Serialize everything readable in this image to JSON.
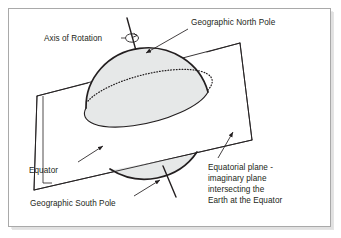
{
  "figure": {
    "type": "diagram",
    "background_color": "#ffffff",
    "frame": {
      "border_color": "#a9a9a9",
      "fill_color": "#ffffff",
      "shadow_color": "#c8c8c8"
    }
  },
  "labels": {
    "axis_of_rotation": "Axis of Rotation",
    "geographic_north_pole": "Geographic North Pole",
    "equator": "Equator",
    "geographic_south_pole": "Geographic South Pole",
    "equatorial_plane_line1": "Equatorial plane -",
    "equatorial_plane_line2": "imaginary plane",
    "equatorial_plane_line3": "intersecting the",
    "equatorial_plane_line4": "Earth at the Equator"
  },
  "colors": {
    "line": "#231f20",
    "sphere_fill": "#e6e8e8",
    "sphere_stroke": "#231f20",
    "plane_fill": "#ffffff",
    "plane_stroke": "#231f20",
    "equator_dotted": "#231f20",
    "text": "#231f20"
  },
  "shapes": {
    "sphere": {
      "name": "earth-sphere",
      "center_x": 147,
      "center_y": 101,
      "radius_x": 62,
      "radius_y": 59
    },
    "equatorial_plane": {
      "name": "equatorial-plane",
      "corners": [
        [
          37,
          96
        ],
        [
          240,
          43
        ],
        [
          252,
          140
        ],
        [
          34,
          190
        ]
      ]
    },
    "axis": {
      "name": "axis-of-rotation-line",
      "top": [
        127,
        18
      ],
      "bottom": [
        176,
        197
      ]
    },
    "rotation_arrow": {
      "name": "rotation-direction-arrow",
      "center_x": 132,
      "center_y": 38
    }
  }
}
